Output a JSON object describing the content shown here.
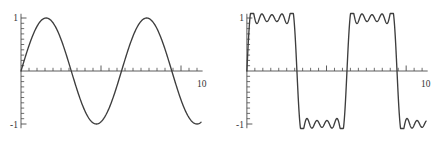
{
  "figure": {
    "title": "",
    "panel_count": 2,
    "background": "#ffffff",
    "curve_color": "#3d3d3d",
    "axis_color": "#4a4a4a"
  },
  "labels": {
    "y_top": "1",
    "y_bottom": "-1",
    "x_right": "10"
  },
  "chart_data": [
    {
      "type": "line",
      "title": "",
      "xlabel": "",
      "ylabel": "",
      "xlim": [
        0,
        11.3
      ],
      "ylim": [
        -1.12,
        1.12
      ],
      "grid": false,
      "legend": null,
      "xticks_major": [
        5,
        10
      ],
      "xticks_minor": [
        0.5,
        1,
        1.5,
        2,
        2.5,
        3,
        3.5,
        4,
        4.5,
        5.5,
        6,
        6.5,
        7,
        7.5,
        8,
        8.5,
        9,
        9.5,
        10.5,
        11
      ],
      "yticks_minor": [
        -1,
        -0.9,
        -0.8,
        -0.7,
        -0.6,
        -0.5,
        -0.4,
        -0.3,
        -0.2,
        -0.1,
        0.1,
        0.2,
        0.3,
        0.4,
        0.5,
        0.6,
        0.7,
        0.8,
        0.9,
        1
      ],
      "xtick_labels": [
        "10"
      ],
      "ytick_labels": [
        "1",
        "-1"
      ],
      "series": [
        {
          "name": "sine",
          "description": "sin(x)",
          "x": [
            0,
            0.25,
            0.5,
            0.75,
            1,
            1.25,
            1.5,
            1.5708,
            1.75,
            2,
            2.25,
            2.5,
            2.75,
            3,
            3.1416,
            3.25,
            3.5,
            3.75,
            4,
            4.25,
            4.5,
            4.7124,
            5,
            5.25,
            5.5,
            5.75,
            6,
            6.2832,
            6.5,
            6.75,
            7,
            7.25,
            7.5,
            7.854,
            8,
            8.25,
            8.5,
            8.75,
            9,
            9.25,
            9.4248,
            9.75,
            10,
            10.25,
            10.5,
            10.75,
            11,
            11.2
          ],
          "y": [
            0,
            0.247,
            0.479,
            0.682,
            0.841,
            0.949,
            0.997,
            1,
            0.984,
            0.909,
            0.778,
            0.598,
            0.382,
            0.141,
            0,
            -0.108,
            -0.351,
            -0.572,
            -0.757,
            -0.895,
            -0.978,
            -1,
            -0.959,
            -0.881,
            -0.706,
            -0.501,
            -0.279,
            0,
            0.215,
            0.428,
            0.657,
            0.835,
            0.938,
            1,
            0.989,
            0.922,
            0.798,
            0.625,
            0.412,
            0.174,
            0,
            -0.298,
            -0.544,
            -0.749,
            -0.88,
            -0.976,
            -1,
            -0.983
          ]
        }
      ]
    },
    {
      "type": "line",
      "title": "",
      "xlabel": "",
      "ylabel": "",
      "xlim": [
        0,
        11.3
      ],
      "ylim": [
        -1.12,
        1.12
      ],
      "grid": false,
      "legend": null,
      "xticks_major": [
        5,
        10
      ],
      "xticks_minor": [
        0.5,
        1,
        1.5,
        2,
        2.5,
        3,
        3.5,
        4,
        4.5,
        5.5,
        6,
        6.5,
        7,
        7.5,
        8,
        8.5,
        9,
        9.5,
        10.5,
        11
      ],
      "yticks_minor": [
        -1,
        -0.9,
        -0.8,
        -0.7,
        -0.6,
        -0.5,
        -0.4,
        -0.3,
        -0.2,
        -0.1,
        0.1,
        0.2,
        0.3,
        0.4,
        0.5,
        0.6,
        0.7,
        0.8,
        0.9,
        1
      ],
      "xtick_labels": [
        "10"
      ],
      "ytick_labels": [
        "1",
        "-1"
      ],
      "series": [
        {
          "name": "trapezoid-partial-sum",
          "description": "Fourier partial sum of a trapezoidal wave showing Gibbs ripples on the plateaus",
          "ripple_peaks_per_plateau": 4,
          "ripple_amplitude": 0.075,
          "plateau_level": 1.0
        }
      ]
    }
  ]
}
